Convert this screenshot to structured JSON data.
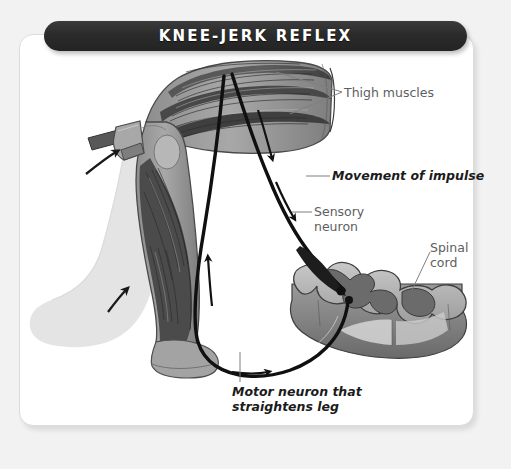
{
  "page": {
    "background_color": "#f2f2f2",
    "card_color": "#ffffff"
  },
  "banner": {
    "title": "KNEE-JERK REFLEX",
    "background_color": "#2b2b2b",
    "text_color": "#ffffff"
  },
  "diagram": {
    "palette": {
      "muscle_dark": "#4a4a4a",
      "limb_mid": "#9a9a9a",
      "ghost_leg": "#e2e2e2",
      "nerve": "#111111",
      "gray_matter": "#6e6e6e",
      "white_matter": "#b5b5b5",
      "label_plain": "#5e5e5e",
      "label_bold": "#1b1b1b",
      "leader_line": "#8a8a8a"
    },
    "labels": [
      {
        "id": "thigh",
        "text": "Thigh muscles",
        "style": "plain"
      },
      {
        "id": "move",
        "text": "Movement of impulse",
        "style": "bold-italic"
      },
      {
        "id": "sensory",
        "text": "Sensory\nneuron",
        "style": "plain"
      },
      {
        "id": "spinal",
        "text": "Spinal\ncord",
        "style": "plain"
      },
      {
        "id": "motor",
        "text": "Motor neuron that\nstraightens leg",
        "style": "bold-italic"
      }
    ],
    "parts": [
      {
        "name": "reflex-hammer",
        "description": "gray mallet striking below the knee"
      },
      {
        "name": "hammer-swing-arrow",
        "description": "curved arrow showing hammer motion"
      },
      {
        "name": "leg-ghost",
        "description": "pale outline of leg in kicked-out position"
      },
      {
        "name": "leg-kick-arrow",
        "description": "curved arrow showing lower leg swinging forward"
      },
      {
        "name": "thigh-muscle-group",
        "description": "striated quadriceps and hamstring muscles"
      },
      {
        "name": "sensory-nerve-path",
        "description": "nerve running from thigh down to spinal cord"
      },
      {
        "name": "motor-nerve-path",
        "description": "nerve looping from spinal cord back to leg"
      },
      {
        "name": "spinal-cord-section",
        "description": "3D cross section with butterfly gray matter"
      }
    ]
  }
}
